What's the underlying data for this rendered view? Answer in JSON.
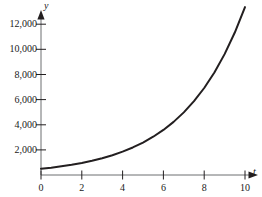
{
  "chart_data": {
    "type": "line",
    "title": "",
    "subtitle": "",
    "xlabel": "t",
    "ylabel": "y",
    "grid": false,
    "legend": null,
    "xlim": [
      0,
      10.8
    ],
    "ylim": [
      0,
      13200
    ],
    "xticks": [
      0,
      2,
      4,
      6,
      8,
      10
    ],
    "xtick_labels": [
      "0",
      "2",
      "4",
      "6",
      "8",
      "10"
    ],
    "yticks": [
      2000,
      4000,
      6000,
      8000,
      10000,
      12000
    ],
    "ytick_labels": [
      "2,000",
      "4,000",
      "6,000",
      "8,000",
      "10,000",
      "12,000"
    ],
    "series": [
      {
        "name": "exponential-growth",
        "color": "#231f20",
        "x": [
          0,
          0.5,
          1,
          1.5,
          2,
          2.5,
          3,
          3.5,
          4,
          4.5,
          5,
          5.5,
          6,
          6.5,
          7,
          7.5,
          8,
          8.5,
          9,
          9.5,
          10
        ],
        "y": [
          500,
          589,
          695,
          819,
          965,
          1137,
          1340,
          1579,
          1861,
          2194,
          2585,
          3047,
          3590,
          4231,
          4986,
          5876,
          6925,
          8161,
          9619,
          11336,
          13360
        ]
      }
    ],
    "axis_arrows": {
      "x": "right",
      "y": "up"
    },
    "axis_color": "#231f20",
    "background": "#ffffff"
  },
  "axis_labels": {
    "x_name": "t",
    "y_name": "y"
  }
}
